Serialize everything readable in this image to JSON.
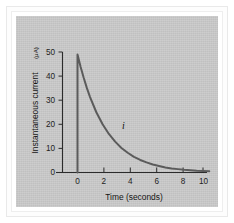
{
  "figure": {
    "background_color": "#c9c9c9",
    "frame_color": "#ffffff",
    "curve_color": "#5b5b5b",
    "axis_color": "#2b2b2b"
  },
  "chart_data": {
    "type": "line",
    "title": "",
    "xlabel": "Time (seconds)",
    "ylabel": "Instantaneous current",
    "ylabel_units": "(μA)",
    "ylabel_full": "Instantaneous current (μA)",
    "xlim": [
      -1.2,
      11.0
    ],
    "ylim": [
      0,
      53
    ],
    "xticks": [
      0,
      2,
      4,
      6,
      8,
      10
    ],
    "xticklabels": [
      "0",
      "2",
      "4",
      "6",
      "8",
      "10"
    ],
    "yticks": [
      0,
      10,
      20,
      30,
      40,
      50
    ],
    "yticklabels": [
      "0",
      "10",
      "20",
      "30",
      "40",
      "50"
    ],
    "grid": false,
    "legend": false,
    "annotations": [
      {
        "text": "i",
        "x": 3.4,
        "y": 19.5,
        "style": "italic"
      }
    ],
    "series": [
      {
        "name": "i",
        "description": "Capacitor discharge current, vertical rise at t=0 then exponential decay",
        "x": [
          0,
          0,
          0.25,
          0.5,
          0.75,
          1,
          1.5,
          2,
          2.5,
          3,
          3.5,
          4,
          4.5,
          5,
          5.5,
          6,
          6.5,
          7,
          7.5,
          8,
          8.5,
          9,
          9.5,
          10,
          10.5
        ],
        "values": [
          0,
          49,
          43.8,
          39.2,
          35.0,
          31.3,
          25.0,
          20.0,
          16.0,
          12.8,
          10.2,
          8.2,
          6.5,
          5.2,
          4.2,
          3.3,
          2.7,
          2.1,
          1.7,
          1.4,
          1.1,
          0.9,
          0.7,
          0.6,
          0.5
        ]
      }
    ]
  }
}
